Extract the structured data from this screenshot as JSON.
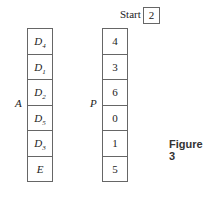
{
  "start": {
    "label": "Start",
    "value": "2"
  },
  "array_A": {
    "label": "A",
    "cells": [
      {
        "base": "D",
        "sub": "4"
      },
      {
        "base": "D",
        "sub": "1"
      },
      {
        "base": "D",
        "sub": "2"
      },
      {
        "base": "D",
        "sub": "5"
      },
      {
        "base": "D",
        "sub": "3"
      },
      {
        "base": "E",
        "sub": ""
      }
    ]
  },
  "array_P": {
    "label": "P",
    "cells": [
      "4",
      "3",
      "6",
      "0",
      "1",
      "5"
    ]
  },
  "caption": "Figure 3"
}
